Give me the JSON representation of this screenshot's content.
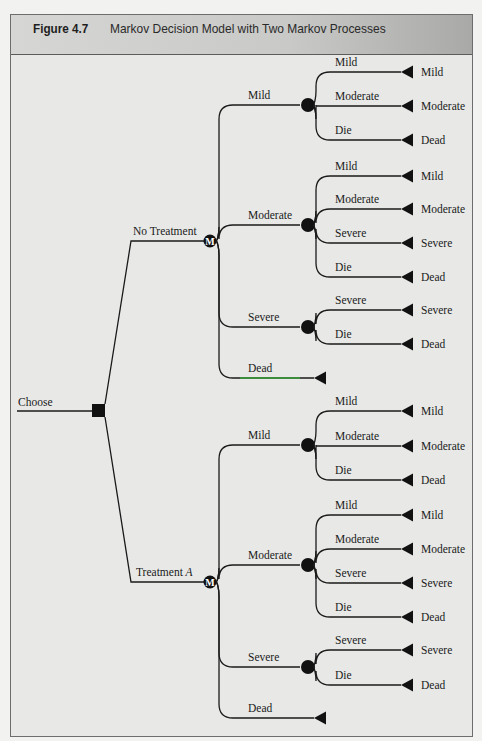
{
  "figure": {
    "number": "Figure 4.7",
    "title": "Markov Decision Model with Two Markov Processes"
  },
  "colors": {
    "line": "#1a1a1a",
    "header_bg": "#c9c9c7",
    "panel_bg": "#e8e9e7",
    "highlight_line": "#3aa03a"
  },
  "tree": {
    "root": {
      "label": "Choose",
      "node_type": "decision-square"
    },
    "arms": [
      {
        "label": "No Treatment",
        "node_type": "markov-M",
        "node_glyph": "M",
        "states": [
          {
            "label": "Mild",
            "transitions": [
              {
                "label": "Mild",
                "terminal": "Mild"
              },
              {
                "label": "Moderate",
                "terminal": "Moderate"
              },
              {
                "label": "Die",
                "terminal": "Dead"
              }
            ]
          },
          {
            "label": "Moderate",
            "transitions": [
              {
                "label": "Mild",
                "terminal": "Mild"
              },
              {
                "label": "Moderate",
                "terminal": "Moderate"
              },
              {
                "label": "Severe",
                "terminal": "Severe"
              },
              {
                "label": "Die",
                "terminal": "Dead"
              }
            ]
          },
          {
            "label": "Severe",
            "transitions": [
              {
                "label": "Severe",
                "terminal": "Severe"
              },
              {
                "label": "Die",
                "terminal": "Dead"
              }
            ]
          },
          {
            "label": "Dead",
            "transitions": []
          }
        ]
      },
      {
        "label": "Treatment",
        "label_italic": "A",
        "node_type": "markov-M",
        "node_glyph": "M",
        "states": [
          {
            "label": "Mild",
            "transitions": [
              {
                "label": "Mild",
                "terminal": "Mild"
              },
              {
                "label": "Moderate",
                "terminal": "Moderate"
              },
              {
                "label": "Die",
                "terminal": "Dead"
              }
            ]
          },
          {
            "label": "Moderate",
            "transitions": [
              {
                "label": "Mild",
                "terminal": "Mild"
              },
              {
                "label": "Moderate",
                "terminal": "Moderate"
              },
              {
                "label": "Severe",
                "terminal": "Severe"
              },
              {
                "label": "Die",
                "terminal": "Dead"
              }
            ]
          },
          {
            "label": "Severe",
            "transitions": [
              {
                "label": "Severe",
                "terminal": "Severe"
              },
              {
                "label": "Die",
                "terminal": "Dead"
              }
            ]
          },
          {
            "label": "Dead",
            "transitions": []
          }
        ]
      }
    ]
  }
}
